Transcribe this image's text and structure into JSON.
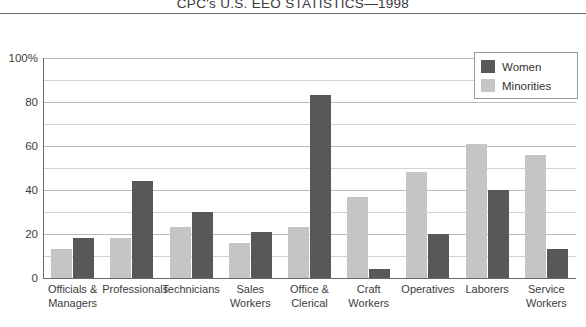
{
  "chart_data": {
    "type": "bar",
    "title": "CPC's U.S. EEO STATISTICS—1998",
    "xlabel": "",
    "ylabel": "",
    "ylim": [
      0,
      100
    ],
    "yticks": [
      0,
      20,
      40,
      60,
      80,
      100
    ],
    "ytick_labels": [
      "0",
      "20",
      "40",
      "60",
      "80",
      "100%"
    ],
    "minor_yticks": [
      10,
      30,
      50,
      70,
      90
    ],
    "grid": true,
    "legend_position": "upper right",
    "categories": [
      "Officials & Managers",
      "Professionals",
      "Technicians",
      "Sales Workers",
      "Office & Clerical",
      "Craft Workers",
      "Operatives",
      "Laborers",
      "Service Workers"
    ],
    "series": [
      {
        "name": "Minorities",
        "color": "#c5c5c5",
        "values": [
          13,
          18,
          23,
          16,
          23,
          37,
          48,
          61,
          56
        ]
      },
      {
        "name": "Women",
        "color": "#585858",
        "values": [
          18,
          44,
          30,
          21,
          83,
          4,
          20,
          40,
          13
        ]
      }
    ]
  },
  "legend": {
    "entries": [
      {
        "label": "Women",
        "color": "#585858"
      },
      {
        "label": "Minorities",
        "color": "#c5c5c5"
      }
    ]
  }
}
